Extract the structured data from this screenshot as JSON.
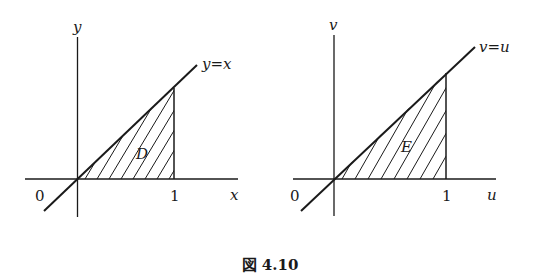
{
  "figure": {
    "caption": "図 4.10",
    "left": {
      "region_label": "D",
      "x_axis_label": "x",
      "y_axis_label": "y",
      "line_label": "y=x",
      "origin_label": "0",
      "tick_label": "1"
    },
    "right": {
      "region_label": "E",
      "x_axis_label": "u",
      "y_axis_label": "v",
      "line_label": "v=u",
      "origin_label": "0",
      "tick_label": "1"
    }
  },
  "colors": {
    "ink": "#1a1a1a",
    "background": "#ffffff"
  }
}
